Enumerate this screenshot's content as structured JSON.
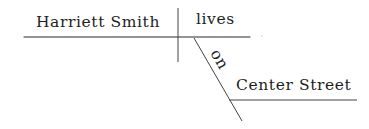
{
  "diagram": {
    "type": "sentence-diagram",
    "subject": "Harriett Smith",
    "verb": "lives",
    "modifier": {
      "preposition": "on",
      "object": "Center Street"
    },
    "colors": {
      "line": "#2a2a2a",
      "text": "#1e1e1e",
      "background": "#ffffff"
    }
  }
}
